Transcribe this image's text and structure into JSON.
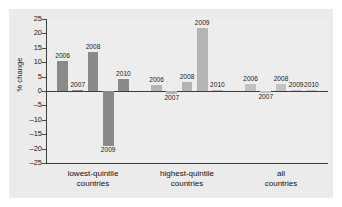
{
  "chart_data": {
    "type": "bar",
    "title": "",
    "subtitle": "",
    "xlabel": "",
    "ylabel": "% change",
    "ylim": [
      -25,
      25
    ],
    "ytick_values": [
      25,
      20,
      15,
      10,
      5,
      0,
      -5,
      -10,
      -15,
      -20,
      -25
    ],
    "ytick_labels": [
      "25",
      "20",
      "15",
      "10",
      "5",
      "0",
      "-5",
      "-10",
      "-15",
      "-20",
      "-25"
    ],
    "grid": false,
    "legend": "none",
    "categories": [
      "lowest-quintile countries",
      "highest-quintile countries",
      "all countries"
    ],
    "series_labels": [
      "2006",
      "2007",
      "2008",
      "2009",
      "2010"
    ],
    "groups": [
      {
        "name": "lowest-quintile countries",
        "color": "#8a8a8a",
        "bars": [
          {
            "label": "2006",
            "value": 10.5
          },
          {
            "label": "2007",
            "value": 0.4
          },
          {
            "label": "2008",
            "value": 13.5
          },
          {
            "label": "2009",
            "value": -19.0
          },
          {
            "label": "2010",
            "value": 4.0
          }
        ]
      },
      {
        "name": "highest-quintile countries",
        "color": "#b4b4b4",
        "bars": [
          {
            "label": "2006",
            "value": 2.2
          },
          {
            "label": "2007",
            "value": -1.0
          },
          {
            "label": "2008",
            "value": 3.2
          },
          {
            "label": "2009",
            "value": 22.0
          },
          {
            "label": "2010",
            "value": 0.5
          }
        ]
      },
      {
        "name": "all countries",
        "color": "#c2c2c2",
        "bars": [
          {
            "label": "2006",
            "value": 2.4
          },
          {
            "label": "2007",
            "value": -0.6
          },
          {
            "label": "2008",
            "value": 2.4
          },
          {
            "label": "2009",
            "value": 0.4
          },
          {
            "label": "2010",
            "value": 0.5
          }
        ]
      }
    ],
    "colors": {
      "bar_dark": "#8a8a8a",
      "bar_mid": "#b4b4b4",
      "bar_light": "#c2c2c2",
      "axis": "#3c3c3c",
      "panel_bg": "#ebebeb",
      "plot_bg": "#ededed",
      "text": "#1a1a1a"
    }
  },
  "axis": {
    "y_title": "% change"
  }
}
